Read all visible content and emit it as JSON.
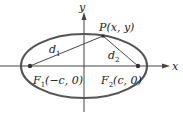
{
  "diagram": {
    "type": "ellipse-foci",
    "axes": {
      "x_label": "x",
      "y_label": "y"
    },
    "point": {
      "label": "P(x, y)"
    },
    "distances": {
      "d1": {
        "base": "d",
        "sub": "1"
      },
      "d2": {
        "base": "d",
        "sub": "2"
      }
    },
    "foci": {
      "f1": {
        "base": "F",
        "sub": "1",
        "coords": "(−c, 0)"
      },
      "f2": {
        "base": "F",
        "sub": "2",
        "coords": "(c, 0)"
      }
    },
    "colors": {
      "ellipse": "#555555",
      "axes": "#444444",
      "lines": "#333333",
      "text": "#222222"
    }
  }
}
